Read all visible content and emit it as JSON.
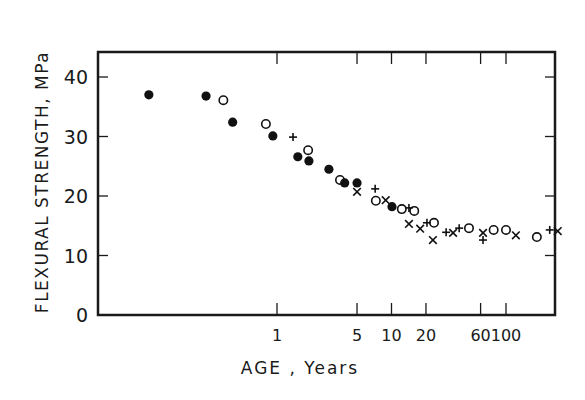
{
  "chart_data": {
    "type": "scatter",
    "title": "",
    "xlabel": "AGE , Years",
    "ylabel": "FLEXURAL STRENGTH, MPa",
    "xscale": "log",
    "xlim": [
      0.027,
      270
    ],
    "ylim": [
      0,
      44
    ],
    "grid": false,
    "legend": null,
    "x_ticks": [
      1,
      5,
      10,
      20,
      60,
      100
    ],
    "x_tick_labels": [
      "1",
      "5",
      "10",
      "20",
      "60",
      "100"
    ],
    "y_ticks": [
      0,
      10,
      20,
      30,
      40
    ],
    "y_tick_labels": [
      "0",
      "10",
      "20",
      "30",
      "40"
    ],
    "series": [
      {
        "name": "filled-circle",
        "marker": "filled-circle",
        "points": [
          [
            0.076,
            37.0
          ],
          [
            0.24,
            36.8
          ],
          [
            0.41,
            32.4
          ],
          [
            0.92,
            30.1
          ],
          [
            1.52,
            26.6
          ],
          [
            1.9,
            25.9
          ],
          [
            2.84,
            24.5
          ],
          [
            3.9,
            22.2
          ],
          [
            5.0,
            22.2
          ],
          [
            10.1,
            18.2
          ]
        ]
      },
      {
        "name": "open-circle",
        "marker": "open-circle",
        "points": [
          [
            0.34,
            36.1
          ],
          [
            0.8,
            32.1
          ],
          [
            1.87,
            27.7
          ],
          [
            3.55,
            22.7
          ],
          [
            7.3,
            19.2
          ],
          [
            12.3,
            17.8
          ],
          [
            15.8,
            17.5
          ],
          [
            23.5,
            15.5
          ],
          [
            47.5,
            14.6
          ],
          [
            78,
            14.3
          ],
          [
            100,
            14.3
          ],
          [
            186,
            13.1
          ]
        ]
      },
      {
        "name": "plus",
        "marker": "plus",
        "points": [
          [
            1.38,
            29.9
          ],
          [
            7.2,
            21.2
          ],
          [
            14.2,
            18.0
          ],
          [
            20.4,
            15.5
          ],
          [
            30,
            13.9
          ],
          [
            39,
            14.6
          ],
          [
            63,
            12.6
          ],
          [
            241,
            14.3
          ]
        ]
      },
      {
        "name": "cross",
        "marker": "x",
        "points": [
          [
            5.0,
            20.7
          ],
          [
            8.9,
            19.3
          ],
          [
            14.2,
            15.3
          ],
          [
            17.8,
            14.5
          ],
          [
            23,
            12.6
          ],
          [
            34.5,
            13.8
          ],
          [
            63,
            13.8
          ],
          [
            122,
            13.4
          ],
          [
            283,
            14.1
          ]
        ]
      }
    ]
  },
  "axes": {
    "ylabel": "FLEXURAL STRENGTH, MPa",
    "xlabel": "AGE , Years",
    "y_tick_labels": [
      "0",
      "10",
      "20",
      "30",
      "40"
    ],
    "x_tick_labels": [
      "1",
      "5",
      "10",
      "20",
      "60",
      "100"
    ]
  }
}
